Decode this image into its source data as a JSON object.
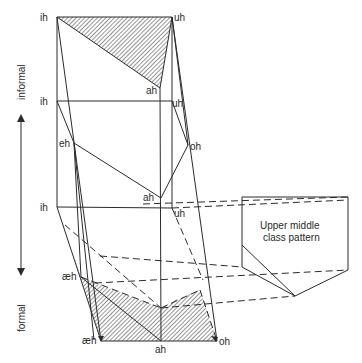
{
  "diagram": {
    "axis": {
      "informal_label": "informal",
      "formal_label": "formal"
    },
    "levels": {
      "top": {
        "ih": "ih",
        "uh": "uh",
        "ah": "ah"
      },
      "middle": {
        "ih": "ih",
        "uh": "uh",
        "eh": "eh",
        "oh": "oh",
        "ah": "ah"
      },
      "lower": {
        "ih": "ih",
        "uh": "uh",
        "ah": "ah"
      },
      "bottom": {
        "aeh_upper": "æh",
        "aeh_lower": "æh",
        "ah": "ah",
        "oh": "oh"
      }
    },
    "inset_box": {
      "line1": "Upper middle",
      "line2": "class pattern"
    },
    "colors": {
      "line": "#2b2b2b",
      "background": "#ffffff"
    }
  }
}
